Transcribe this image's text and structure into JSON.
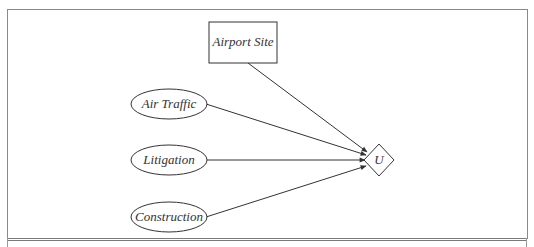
{
  "diagram": {
    "type": "influence-diagram",
    "nodes": [
      {
        "id": "airport_site",
        "label": "Airport Site",
        "shape": "rectangle",
        "kind": "decision"
      },
      {
        "id": "air_traffic",
        "label": "Air Traffic",
        "shape": "ellipse",
        "kind": "chance"
      },
      {
        "id": "litigation",
        "label": "Litigation",
        "shape": "ellipse",
        "kind": "chance"
      },
      {
        "id": "construction",
        "label": "Construction",
        "shape": "ellipse",
        "kind": "chance"
      },
      {
        "id": "utility",
        "label": "U",
        "shape": "diamond",
        "kind": "utility"
      }
    ],
    "edges": [
      {
        "from": "airport_site",
        "to": "utility"
      },
      {
        "from": "air_traffic",
        "to": "utility"
      },
      {
        "from": "litigation",
        "to": "utility"
      },
      {
        "from": "construction",
        "to": "utility"
      }
    ]
  },
  "colors": {
    "stroke": "#333333",
    "frame": "#8a8a8a",
    "background": "#ffffff"
  }
}
